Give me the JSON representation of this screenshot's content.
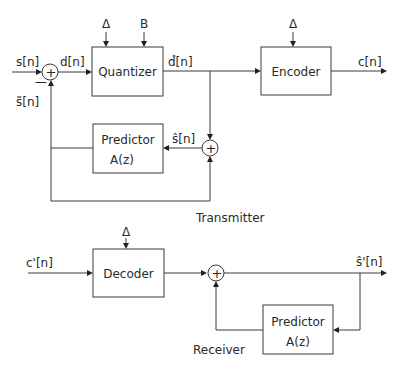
{
  "diagram": {
    "type": "block-diagram",
    "colors": {
      "line": "#3a3a3a",
      "text": "#2a2a2a",
      "background": "#ffffff"
    },
    "transmitter": {
      "section_label": "Transmitter",
      "input_signal": "s[n]",
      "prediction_signal": "s̃[n]",
      "minus_sign": "—",
      "difference_signal": "d[n]",
      "quantized_signal": "d̂[n]",
      "reconstructed_signal": "ŝ[n]",
      "output_signal": "c[n]",
      "quantizer": {
        "label": "Quantizer",
        "params": [
          "Δ",
          "B"
        ]
      },
      "encoder": {
        "label": "Encoder",
        "param": "Δ"
      },
      "predictor": {
        "line1": "Predictor",
        "line2": "A(z)"
      },
      "summer_symbol": "+"
    },
    "receiver": {
      "section_label": "Receiver",
      "input_signal": "c'[n]",
      "output_signal": "ŝ'[n]",
      "decoder": {
        "label": "Decoder",
        "param": "Δ"
      },
      "predictor": {
        "line1": "Predictor",
        "line2": "A(z)"
      },
      "summer_symbol": "+"
    }
  }
}
